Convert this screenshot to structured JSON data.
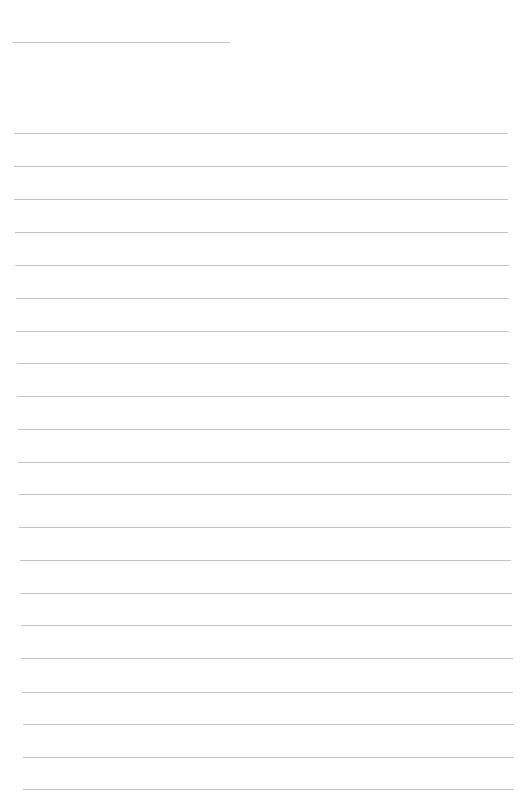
{
  "page": {
    "type": "blank lined paper",
    "background_color": "#ffffff",
    "line_color": "#c4c4c4",
    "header_line": {
      "x_start": 12,
      "x_end": 230,
      "y": 42
    },
    "ruled_lines": [
      {
        "y": 133,
        "x_start": 14,
        "x_end": 508
      },
      {
        "y": 166,
        "x_start": 14,
        "x_end": 508
      },
      {
        "y": 199,
        "x_start": 14,
        "x_end": 508
      },
      {
        "y": 232,
        "x_start": 15,
        "x_end": 508
      },
      {
        "y": 265,
        "x_start": 15,
        "x_end": 509
      },
      {
        "y": 298,
        "x_start": 16,
        "x_end": 509
      },
      {
        "y": 331,
        "x_start": 16,
        "x_end": 509
      },
      {
        "y": 363,
        "x_start": 17,
        "x_end": 509
      },
      {
        "y": 396,
        "x_start": 17,
        "x_end": 510
      },
      {
        "y": 429,
        "x_start": 18,
        "x_end": 510
      },
      {
        "y": 462,
        "x_start": 18,
        "x_end": 510
      },
      {
        "y": 494,
        "x_start": 19,
        "x_end": 511
      },
      {
        "y": 527,
        "x_start": 19,
        "x_end": 511
      },
      {
        "y": 560,
        "x_start": 20,
        "x_end": 511
      },
      {
        "y": 593,
        "x_start": 20,
        "x_end": 512
      },
      {
        "y": 625,
        "x_start": 21,
        "x_end": 512
      },
      {
        "y": 658,
        "x_start": 21,
        "x_end": 513
      },
      {
        "y": 692,
        "x_start": 22,
        "x_end": 513
      },
      {
        "y": 724,
        "x_start": 23,
        "x_end": 514
      },
      {
        "y": 757,
        "x_start": 23,
        "x_end": 514
      },
      {
        "y": 789,
        "x_start": 23,
        "x_end": 514
      }
    ]
  }
}
